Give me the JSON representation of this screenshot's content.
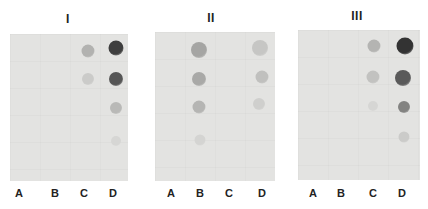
{
  "figure": {
    "panels": [
      {
        "title": "I",
        "title_pos": [
          68,
          12
        ],
        "blot": {
          "x": 10,
          "y": 34,
          "w": 118,
          "h": 147
        },
        "lanes": [
          {
            "label": "A",
            "x": 19
          },
          {
            "label": "B",
            "x": 55
          },
          {
            "label": "C",
            "x": 84
          },
          {
            "label": "D",
            "x": 113
          }
        ],
        "dots": [
          {
            "x": 116,
            "y": 48,
            "r": 7.5,
            "color": "#3e3e3e"
          },
          {
            "x": 116,
            "y": 79,
            "r": 7,
            "color": "#565656"
          },
          {
            "x": 116,
            "y": 108,
            "r": 6,
            "color": "#b9b9b7"
          },
          {
            "x": 116,
            "y": 141,
            "r": 5,
            "color": "#d6d6d4"
          },
          {
            "x": 88,
            "y": 51,
            "r": 6.5,
            "color": "#b2b2b0"
          },
          {
            "x": 88,
            "y": 79,
            "r": 6,
            "color": "#cbcbc9"
          }
        ]
      },
      {
        "title": "II",
        "title_pos": [
          211,
          11
        ],
        "blot": {
          "x": 155,
          "y": 32,
          "w": 120,
          "h": 149
        },
        "lanes": [
          {
            "label": "A",
            "x": 171
          },
          {
            "label": "B",
            "x": 200
          },
          {
            "label": "C",
            "x": 229
          },
          {
            "label": "D",
            "x": 262
          }
        ],
        "dots": [
          {
            "x": 199,
            "y": 50,
            "r": 8,
            "color": "#a5a5a3"
          },
          {
            "x": 199,
            "y": 79,
            "r": 7,
            "color": "#a9a9a7"
          },
          {
            "x": 199,
            "y": 107,
            "r": 6.5,
            "color": "#b5b5b3"
          },
          {
            "x": 200,
            "y": 140,
            "r": 5.5,
            "color": "#d4d4d2"
          },
          {
            "x": 260,
            "y": 48,
            "r": 8,
            "color": "#c6c6c4"
          },
          {
            "x": 262,
            "y": 77,
            "r": 6.5,
            "color": "#c0c0be"
          },
          {
            "x": 259,
            "y": 104,
            "r": 6,
            "color": "#cfcfcd"
          }
        ]
      },
      {
        "title": "III",
        "title_pos": [
          357,
          9
        ],
        "blot": {
          "x": 298,
          "y": 30,
          "w": 122,
          "h": 150
        },
        "lanes": [
          {
            "label": "A",
            "x": 313
          },
          {
            "label": "B",
            "x": 341
          },
          {
            "label": "C",
            "x": 373
          },
          {
            "label": "D",
            "x": 402
          }
        ],
        "dots": [
          {
            "x": 374,
            "y": 46,
            "r": 6.5,
            "color": "#b4b4b2"
          },
          {
            "x": 373,
            "y": 77,
            "r": 6.5,
            "color": "#c2c2c0"
          },
          {
            "x": 373,
            "y": 106,
            "r": 5,
            "color": "#d6d6d4"
          },
          {
            "x": 405,
            "y": 46,
            "r": 8.5,
            "color": "#333333"
          },
          {
            "x": 403,
            "y": 78,
            "r": 8,
            "color": "#5a5a5a"
          },
          {
            "x": 404,
            "y": 107,
            "r": 6,
            "color": "#838381"
          },
          {
            "x": 404,
            "y": 137,
            "r": 5.5,
            "color": "#cbcbc9"
          }
        ]
      }
    ],
    "label_y": 187
  }
}
